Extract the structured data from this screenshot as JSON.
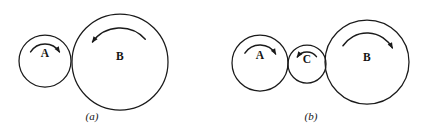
{
  "figure": {
    "background_color": "#ffffff",
    "ink_color": "#1a1a1a",
    "width": 425,
    "height": 131,
    "panels": [
      {
        "id": "panel-a",
        "caption": "(a)",
        "caption_x": 92,
        "caption_y": 117,
        "wheels": [
          {
            "label": "A",
            "cx": 45,
            "cy": 61,
            "r": 26,
            "label_x": 45,
            "label_y": 54,
            "spin": "clockwise",
            "arrow_direction": "right",
            "arc_r": 17,
            "arc_start_deg": 212,
            "arc_end_deg": 328
          },
          {
            "label": "B",
            "cx": 120,
            "cy": 62,
            "r": 48,
            "label_x": 120,
            "label_y": 57,
            "spin": "counter-clockwise",
            "arrow_direction": "left",
            "arc_r": 34,
            "arc_start_deg": 318,
            "arc_end_deg": 216
          }
        ]
      },
      {
        "id": "panel-b",
        "caption": "(b)",
        "caption_x": 311,
        "caption_y": 117,
        "wheels": [
          {
            "label": "A",
            "cx": 260,
            "cy": 63,
            "r": 28,
            "label_x": 260,
            "label_y": 56,
            "spin": "clockwise",
            "arrow_direction": "right",
            "arc_r": 18,
            "arc_start_deg": 213,
            "arc_end_deg": 330
          },
          {
            "label": "C",
            "cx": 307,
            "cy": 64,
            "r": 19,
            "label_x": 307,
            "label_y": 60,
            "spin": "counter-clockwise",
            "arrow_direction": "left",
            "arc_r": 12,
            "arc_start_deg": 322,
            "arc_end_deg": 216
          },
          {
            "label": "B",
            "cx": 367,
            "cy": 62,
            "r": 42,
            "label_x": 367,
            "label_y": 58,
            "spin": "clockwise",
            "arrow_direction": "right",
            "arc_r": 29,
            "arc_start_deg": 214,
            "arc_end_deg": 331
          }
        ]
      }
    ]
  }
}
